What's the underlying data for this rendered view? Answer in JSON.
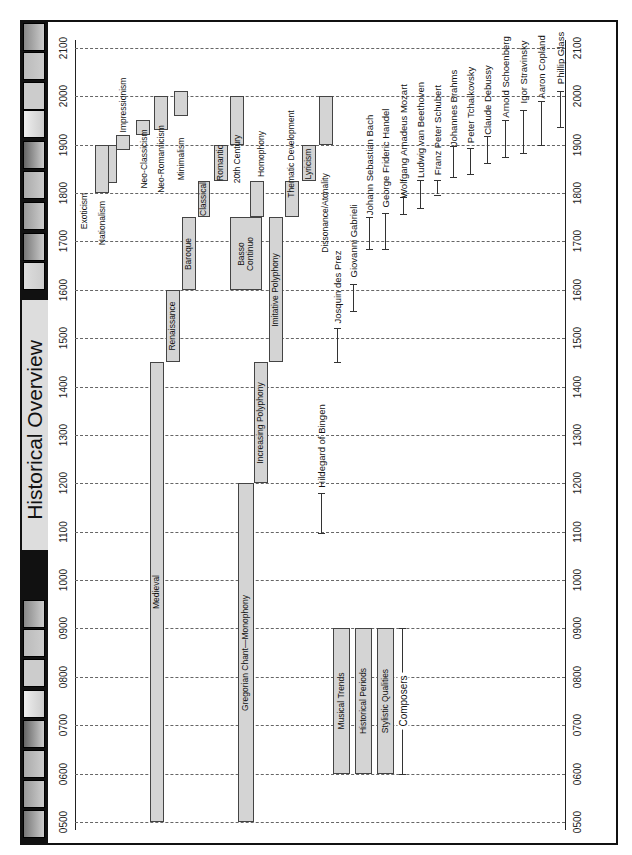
{
  "title": "Historical Overview",
  "axis_ticks": [
    "2100",
    "2000",
    "1900",
    "1800",
    "1700",
    "1600",
    "1500",
    "1400",
    "1300",
    "1200",
    "1100",
    "1000",
    "0900",
    "0800",
    "0700",
    "0600",
    "0500"
  ],
  "chart_data": {
    "type": "timeline",
    "title": "Historical Overview",
    "xlabel": "Year",
    "xlim": [
      500,
      2100
    ],
    "grid": true,
    "orientation": "rotated 90° counter-clockwise",
    "legend": [
      {
        "label": "Musical Trends",
        "start": 600,
        "end": 900
      },
      {
        "label": "Historical Periods",
        "start": 600,
        "end": 900
      },
      {
        "label": "Stylistic Qualities",
        "start": 600,
        "end": 900
      },
      {
        "label": "Composers",
        "start": 600,
        "end": 900
      }
    ],
    "musical_trends": [
      {
        "label": "Exoticism",
        "start": 1820,
        "end": 1900
      },
      {
        "label": "Nationalism",
        "start": 1800,
        "end": 1900
      },
      {
        "label": "Impressionism",
        "start": 1890,
        "end": 1920
      },
      {
        "label": "Neo-Classicism",
        "start": 1920,
        "end": 1950
      },
      {
        "label": "Neo-Romanticism",
        "start": 1930,
        "end": 2000
      },
      {
        "label": "Minimalism",
        "start": 1960,
        "end": 2010
      }
    ],
    "historical_periods": [
      {
        "label": "Medieval",
        "start": 500,
        "end": 1450
      },
      {
        "label": "Renaissance",
        "start": 1450,
        "end": 1600
      },
      {
        "label": "Baroque",
        "start": 1600,
        "end": 1750
      },
      {
        "label": "Classical",
        "start": 1750,
        "end": 1825
      },
      {
        "label": "Romantic",
        "start": 1825,
        "end": 1900
      },
      {
        "label": "20th Century",
        "start": 1900,
        "end": 2000
      }
    ],
    "stylistic_qualities": [
      {
        "label": "Gregorian Chant—Monophony",
        "start": 500,
        "end": 1200
      },
      {
        "label": "Increasing Polyphony",
        "start": 1200,
        "end": 1450
      },
      {
        "label": "Basso Continuo",
        "start": 1600,
        "end": 1750
      },
      {
        "label": "Homophony",
        "start": 1750,
        "end": 1825
      },
      {
        "label": "Imitative Polyphony",
        "start": 1450,
        "end": 1750
      },
      {
        "label": "Thematic Development",
        "start": 1750,
        "end": 1825
      },
      {
        "label": "Lyricism",
        "start": 1825,
        "end": 1900
      },
      {
        "label": "Dissonance/Atonality",
        "start": 1900,
        "end": 2000
      }
    ],
    "composers": [
      {
        "label": "Hildegard of Bingen",
        "start": 1098,
        "end": 1179
      },
      {
        "label": "Josquin des Prez",
        "start": 1450,
        "end": 1521
      },
      {
        "label": "Giovanni Gabrieli",
        "start": 1557,
        "end": 1612
      },
      {
        "label": "Johann Sebastian Bach",
        "start": 1685,
        "end": 1750
      },
      {
        "label": "George Frideric Handel",
        "start": 1685,
        "end": 1759
      },
      {
        "label": "Wolfgang Amadeus Mozart",
        "start": 1756,
        "end": 1791
      },
      {
        "label": "Ludwig van Beethoven",
        "start": 1770,
        "end": 1827
      },
      {
        "label": "Franz Peter Schubert",
        "start": 1797,
        "end": 1828
      },
      {
        "label": "Johannes Brahms",
        "start": 1833,
        "end": 1897
      },
      {
        "label": "Peter Tchaikovsky",
        "start": 1840,
        "end": 1893
      },
      {
        "label": "Claude Debussy",
        "start": 1862,
        "end": 1918
      },
      {
        "label": "Arnold Schoenberg",
        "start": 1874,
        "end": 1951
      },
      {
        "label": "Igor Stravinsky",
        "start": 1882,
        "end": 1971
      },
      {
        "label": "Aaron Copland",
        "start": 1900,
        "end": 1990
      },
      {
        "label": "Phillip Glass",
        "start": 1937,
        "end": 2010
      }
    ]
  }
}
